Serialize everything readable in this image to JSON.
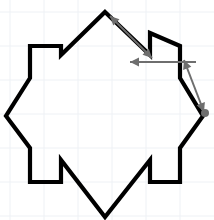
{
  "figure": {
    "canvas": {
      "width": 214,
      "height": 220,
      "background": "#ffffff"
    },
    "grid": {
      "visible": true,
      "color": "#eef1f5",
      "spacing": 34,
      "origin_x": 10,
      "origin_y": 12,
      "x_lines": [
        10,
        44,
        78,
        112,
        146,
        180
      ],
      "y_lines": [
        12,
        46,
        80,
        114,
        148,
        182,
        216
      ]
    },
    "style": {
      "outline_color": "#000000",
      "outline_width": 4.2,
      "arrow_color": "#6e6e6e",
      "arrow_width": 2.0,
      "marker_color": "#6e6e6e",
      "marker_radius": 4
    },
    "polygon": {
      "name": "star-rosette-outline",
      "closed": true,
      "points": "105,12 150,55 150,33 180,46 180,78 203,116 180,148 180,182 150,182 150,160 105,217 61,160 61,182 30,182 30,148 6,116 30,78 30,46 61,46 61,55"
    },
    "key_vertices": {
      "top": [
        105,
        12
      ],
      "right": [
        203,
        116
      ],
      "bottom": [
        105,
        217
      ],
      "left": [
        6,
        116
      ]
    },
    "arrows": [
      {
        "name": "arrow-top-diagonal",
        "double_headed": true,
        "from": [
          152,
          58
        ],
        "to": [
          110,
          16
        ],
        "label": ""
      },
      {
        "name": "arrow-horizontal",
        "double_headed": false,
        "from": [
          196,
          62
        ],
        "to": [
          130,
          62
        ],
        "label": ""
      },
      {
        "name": "arrow-right-diagonal",
        "double_headed": true,
        "from": [
          204,
          112
        ],
        "to": [
          184,
          60
        ],
        "label": ""
      }
    ],
    "markers": [
      {
        "name": "right-vertex-dot",
        "cx": 205,
        "cy": 113,
        "r": 4
      }
    ]
  }
}
